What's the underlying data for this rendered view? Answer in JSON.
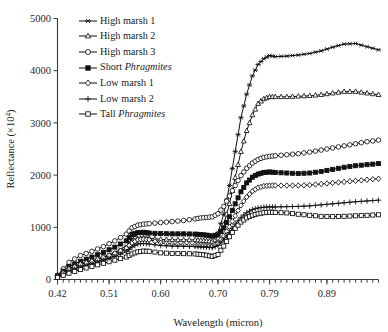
{
  "chart_data": {
    "type": "line",
    "title": "",
    "xlabel": "Wavelength (micron)",
    "ylabel": "Reflectance (×10⁴)",
    "xlim": [
      0.42,
      0.98
    ],
    "ylim": [
      0,
      5000
    ],
    "grid": false,
    "legend_position": "top-left inside",
    "xticks": [
      0.42,
      0.51,
      0.6,
      0.7,
      0.79,
      0.89
    ],
    "xticklabels": [
      "0.42",
      "0.51",
      "0.60",
      "0.70",
      "0.79",
      "0.89"
    ],
    "yticks": [
      0,
      1000,
      2000,
      3000,
      4000,
      5000
    ],
    "yticklabels": [
      "0",
      "1000",
      "2000",
      "3000",
      "4000",
      "5000"
    ],
    "x": [
      0.42,
      0.44,
      0.46,
      0.48,
      0.5,
      0.52,
      0.54,
      0.55,
      0.56,
      0.57,
      0.58,
      0.6,
      0.62,
      0.64,
      0.66,
      0.67,
      0.68,
      0.69,
      0.7,
      0.71,
      0.72,
      0.73,
      0.74,
      0.75,
      0.76,
      0.77,
      0.78,
      0.79,
      0.8,
      0.82,
      0.84,
      0.86,
      0.88,
      0.9,
      0.92,
      0.94,
      0.96,
      0.98
    ],
    "series": [
      {
        "name": "High marsh 1",
        "marker": "asterisk",
        "values": [
          60,
          210,
          300,
          360,
          430,
          520,
          640,
          780,
          880,
          900,
          890,
          870,
          860,
          860,
          860,
          850,
          840,
          830,
          900,
          1250,
          1800,
          2450,
          3100,
          3550,
          3900,
          4120,
          4230,
          4290,
          4270,
          4280,
          4300,
          4330,
          4380,
          4450,
          4510,
          4520,
          4460,
          4400
        ]
      },
      {
        "name": "High marsh 2",
        "marker": "triangle-up",
        "values": [
          50,
          180,
          260,
          320,
          390,
          470,
          580,
          700,
          780,
          800,
          790,
          770,
          760,
          760,
          760,
          750,
          740,
          730,
          790,
          1050,
          1450,
          1950,
          2450,
          2850,
          3150,
          3370,
          3460,
          3500,
          3500,
          3500,
          3510,
          3520,
          3540,
          3570,
          3600,
          3600,
          3570,
          3540
        ]
      },
      {
        "name": "High marsh 3",
        "marker": "circle",
        "values": [
          80,
          330,
          460,
          540,
          630,
          740,
          870,
          990,
          1040,
          1060,
          1070,
          1090,
          1110,
          1130,
          1160,
          1180,
          1190,
          1200,
          1260,
          1400,
          1600,
          1800,
          1990,
          2130,
          2230,
          2300,
          2340,
          2360,
          2370,
          2390,
          2410,
          2440,
          2480,
          2520,
          2560,
          2600,
          2640,
          2670
        ]
      },
      {
        "name": "Short Phragmites",
        "marker": "square-solid",
        "values": [
          70,
          250,
          350,
          430,
          520,
          620,
          740,
          860,
          900,
          905,
          890,
          880,
          875,
          875,
          870,
          860,
          850,
          830,
          860,
          990,
          1200,
          1450,
          1680,
          1850,
          1960,
          2020,
          2050,
          2060,
          2050,
          2040,
          2030,
          2040,
          2070,
          2110,
          2150,
          2180,
          2200,
          2220
        ]
      },
      {
        "name": "Low marsh 1",
        "marker": "diamond",
        "values": [
          55,
          200,
          290,
          350,
          420,
          500,
          600,
          700,
          760,
          770,
          760,
          700,
          680,
          670,
          665,
          660,
          650,
          640,
          690,
          830,
          1010,
          1220,
          1420,
          1580,
          1690,
          1760,
          1790,
          1800,
          1800,
          1800,
          1800,
          1810,
          1830,
          1850,
          1870,
          1890,
          1910,
          1930
        ]
      },
      {
        "name": "Low marsh 2",
        "marker": "plus",
        "values": [
          45,
          160,
          240,
          300,
          370,
          440,
          530,
          620,
          680,
          690,
          680,
          650,
          640,
          635,
          630,
          625,
          620,
          610,
          650,
          760,
          900,
          1060,
          1190,
          1280,
          1340,
          1370,
          1385,
          1390,
          1390,
          1395,
          1400,
          1410,
          1430,
          1450,
          1470,
          1490,
          1505,
          1520
        ]
      },
      {
        "name": "Tall Phragmites",
        "marker": "square-open",
        "values": [
          40,
          120,
          190,
          250,
          310,
          370,
          430,
          490,
          530,
          545,
          540,
          510,
          500,
          495,
          490,
          480,
          465,
          440,
          480,
          640,
          820,
          980,
          1100,
          1180,
          1230,
          1260,
          1280,
          1290,
          1285,
          1275,
          1250,
          1230,
          1210,
          1205,
          1210,
          1220,
          1230,
          1240
        ]
      }
    ]
  },
  "legend": {
    "items": [
      {
        "label_prefix": "High marsh 1",
        "label_italic": "",
        "label_suffix": ""
      },
      {
        "label_prefix": "High marsh 2",
        "label_italic": "",
        "label_suffix": ""
      },
      {
        "label_prefix": "High marsh 3",
        "label_italic": "",
        "label_suffix": ""
      },
      {
        "label_prefix": "Short ",
        "label_italic": "Phragmites",
        "label_suffix": ""
      },
      {
        "label_prefix": "Low marsh 1",
        "label_italic": "",
        "label_suffix": ""
      },
      {
        "label_prefix": "Low marsh 2",
        "label_italic": "",
        "label_suffix": ""
      },
      {
        "label_prefix": "Tall ",
        "label_italic": "Phragmites",
        "label_suffix": ""
      }
    ]
  }
}
